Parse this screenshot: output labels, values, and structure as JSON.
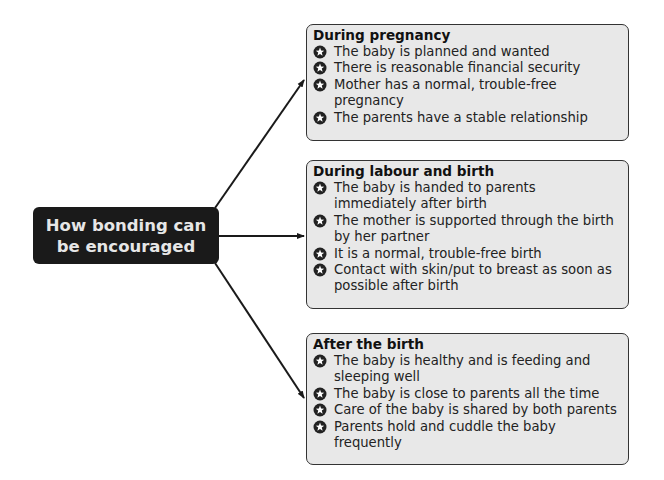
{
  "center": {
    "title": "How bonding can be encouraged"
  },
  "colors": {
    "box_fill": "#e8e8e8",
    "box_border": "#333333",
    "center_fill": "#1a1a1a",
    "center_text": "#e6e6e6",
    "arrow": "#1a1a1a"
  },
  "bullet_icon": "star-circle-icon",
  "boxes": [
    {
      "title": "During pregnancy",
      "items": [
        "The baby is planned and wanted",
        "There is reasonable financial security",
        "Mother has a normal, trouble-free pregnancy",
        "The parents have a stable relationship"
      ]
    },
    {
      "title": "During labour and birth",
      "items": [
        "The baby is handed to parents immediately after birth",
        "The mother is supported through the birth by her partner",
        "It is a normal, trouble-free birth",
        "Contact with skin/put to breast as soon as possible after birth"
      ]
    },
    {
      "title": "After the birth",
      "items": [
        "The baby is healthy and is feeding and sleeping well",
        "The baby is close to parents all the time",
        "Care of the baby is shared by both parents",
        "Parents hold and cuddle the baby frequently"
      ]
    }
  ]
}
